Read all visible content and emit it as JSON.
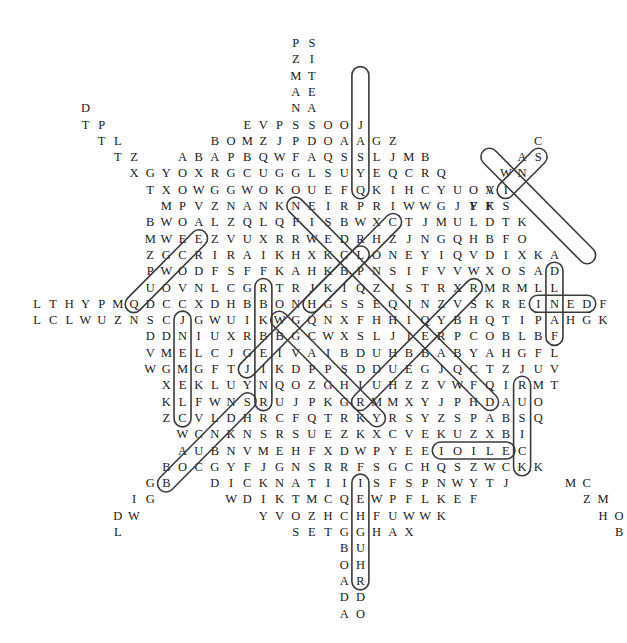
{
  "puzzle": {
    "type": "word-search",
    "grid_origin": {
      "x": 37,
      "y": 43,
      "col_step": 16.17,
      "row_step": 16.3,
      "first_col": -16
    },
    "rows": [
      {
        "row": 0,
        "start_col": 16,
        "letters": "PS"
      },
      {
        "row": 1,
        "start_col": 16,
        "letters": "ZI"
      },
      {
        "row": 2,
        "start_col": 16,
        "letters": "MT"
      },
      {
        "row": 3,
        "start_col": 16,
        "letters": "AE"
      },
      {
        "row": 4,
        "start_col": 16,
        "letters": "NA",
        "extra": [
          {
            "start_col": 3,
            "letters": "D"
          }
        ]
      },
      {
        "row": 5,
        "start_col": 13,
        "letters": "EVPSSOOJ",
        "extra": [
          {
            "start_col": 3,
            "letters": "TP"
          }
        ]
      },
      {
        "row": 6,
        "start_col": 11,
        "letters": "BOMZJPDOAAGZ",
        "extra": [
          {
            "start_col": 4,
            "letters": "TL"
          },
          {
            "start_col": 31,
            "letters": "C"
          }
        ]
      },
      {
        "row": 7,
        "start_col": 9,
        "letters": "ABAPBQWFAQSSLJMB",
        "extra": [
          {
            "start_col": 5,
            "letters": "TZ"
          },
          {
            "start_col": 30,
            "letters": "AS"
          }
        ]
      },
      {
        "row": 8,
        "start_col": 8,
        "letters": "YOXRGCUGGLSUYEQCRQ",
        "extra": [
          {
            "start_col": 6,
            "letters": "XG"
          },
          {
            "start_col": 29,
            "letters": "WN"
          }
        ]
      },
      {
        "row": 9,
        "start_col": 7,
        "letters": "TXOWGGWOKOUEFQKIHCYUOA",
        "extra": [
          {
            "start_col": 28,
            "letters": "VI"
          }
        ]
      },
      {
        "row": 10,
        "start_col": 8,
        "letters": "MPVZNANKNEIRPRIWWGJYFS",
        "extra": [
          {
            "start_col": 27,
            "letters": "FK"
          }
        ]
      },
      {
        "row": 11,
        "start_col": 7,
        "letters": "BWOALZQLQFISBWXCTJMULDTK"
      },
      {
        "row": 12,
        "start_col": 7,
        "letters": "MWEEZVUXRRWEDRHZJNGQHBFO"
      },
      {
        "row": 13,
        "start_col": 7,
        "letters": "ZGCRIRAIKHXKCLONEYIQVDIXKA"
      },
      {
        "row": 14,
        "start_col": 7,
        "letters": "PWODFSFFKAHKBPNSIFVVWXOSAD"
      },
      {
        "row": 15,
        "start_col": 7,
        "letters": "UOVNLCGRTRJKIQZISTRXRMRMLL"
      },
      {
        "row": 16,
        "start_col": 0,
        "letters": "LTHYPMQDCCXDHBBONHGSSEQJNZVSKREINEDF"
      },
      {
        "row": 17,
        "start_col": 0,
        "letters": "LCLWUZNSCJGWUIKWGQNXFHHIQYBHQTIPAHGK"
      },
      {
        "row": 18,
        "start_col": 7,
        "letters": "DDNIUXRBBGCWXSLJIERPCOBLBF"
      },
      {
        "row": 19,
        "start_col": 7,
        "letters": "VMELCJGEIVAIBDUHBBABYAHGFL"
      },
      {
        "row": 20,
        "start_col": 7,
        "letters": "WGMGFTJIKDPPSDDUEGJQCTZJUV"
      },
      {
        "row": 21,
        "start_col": 8,
        "letters": "XEKLUYNQOZGHIUHZZVWFQIRMT"
      },
      {
        "row": 22,
        "start_col": 8,
        "letters": "KLFWNSRUJPKGRMMXYJPHDAUO"
      },
      {
        "row": 23,
        "start_col": 8,
        "letters": "ZCVLDHRCFQTRKYRSYZSPABSQ"
      },
      {
        "row": 24,
        "start_col": 9,
        "letters": "WCNKNSRSUEZKXCVEKUZXBI"
      },
      {
        "row": 25,
        "start_col": 9,
        "letters": "AUBNVMEHFXDWPYEEIOILEC"
      },
      {
        "row": 26,
        "start_col": 8,
        "letters": "BOCGYFJGNSRRFSGCHQSZWCKK"
      },
      {
        "row": 27,
        "start_col": 7,
        "letters": "GB",
        "extra": [
          {
            "start_col": 11,
            "letters": "DICKNATIIISFSPNWYTJ"
          },
          {
            "start_col": 33,
            "letters": "MC"
          }
        ]
      },
      {
        "row": 28,
        "start_col": 6,
        "letters": "IG",
        "extra": [
          {
            "start_col": 12,
            "letters": "WDIKTMCQEWPFLKEF"
          },
          {
            "start_col": 34,
            "letters": "ZM"
          }
        ]
      },
      {
        "row": 29,
        "start_col": 5,
        "letters": "DW",
        "extra": [
          {
            "start_col": 14,
            "letters": "YVOZHCHFUWWK"
          },
          {
            "start_col": 35,
            "letters": "HO"
          }
        ]
      },
      {
        "row": 30,
        "start_col": 5,
        "letters": "L",
        "extra": [
          {
            "start_col": 16,
            "letters": "SETGGHAX"
          },
          {
            "start_col": 36,
            "letters": "B"
          }
        ]
      },
      {
        "row": 31,
        "start_col": 19,
        "letters": "BU"
      },
      {
        "row": 32,
        "start_col": 19,
        "letters": "OH"
      },
      {
        "row": 33,
        "start_col": 19,
        "letters": "AR"
      },
      {
        "row": 34,
        "start_col": 19,
        "letters": "DD"
      },
      {
        "row": 35,
        "start_col": 19,
        "letters": "AO"
      }
    ],
    "found_words": [
      {
        "word": "TEASDALE",
        "direction": "vertical-down",
        "from": {
          "row": 2,
          "col": 20
        },
        "to": {
          "row": 9,
          "col": 20
        }
      },
      {
        "word": "SASKATCHEWAN",
        "note": "diagonal top-right"
      },
      {
        "word": "INED",
        "direction": "horizontal",
        "from": {
          "row": 16,
          "col": 31
        },
        "to": {
          "row": 16,
          "col": 34
        }
      },
      {
        "word": "DLEIF",
        "direction": "vertical-down",
        "from": {
          "row": 14,
          "col": 32
        },
        "to": {
          "row": 18,
          "col": 32
        }
      },
      {
        "word": "MUSICK",
        "direction": "vertical-down",
        "from": {
          "row": 21,
          "col": 30
        },
        "to": {
          "row": 26,
          "col": 30
        }
      },
      {
        "word": "TOILE",
        "direction": "horizontal",
        "from": {
          "row": 25,
          "col": 25
        },
        "to": {
          "row": 25,
          "col": 29
        }
      },
      {
        "word": "SEHGUHR",
        "direction": "vertical-down",
        "from": {
          "row": 27,
          "col": 20
        },
        "to": {
          "row": 33,
          "col": 20
        }
      },
      {
        "word": "RHUBEINR",
        "direction": "vertical-down",
        "from": {
          "row": 15,
          "col": 14
        },
        "to": {
          "row": 22,
          "col": 14
        }
      },
      {
        "word": "SNEMELC",
        "direction": "vertical-down",
        "from": {
          "row": 17,
          "col": 9
        },
        "to": {
          "row": 23,
          "col": 9
        }
      }
    ]
  }
}
